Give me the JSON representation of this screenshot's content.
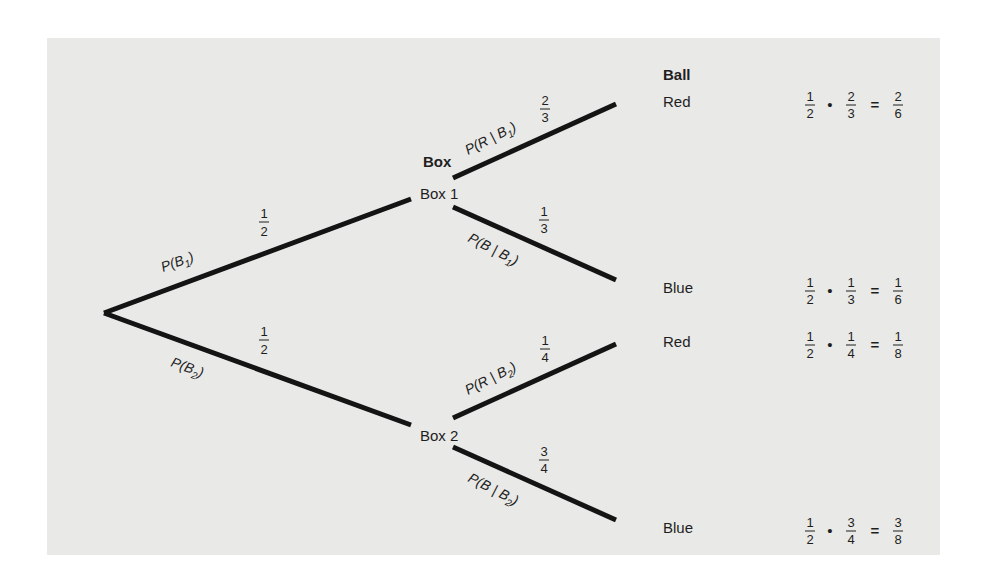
{
  "headers": {
    "box": "Box",
    "ball": "Ball"
  },
  "nodes": {
    "box1": "Box 1",
    "box2": "Box 2",
    "ball_1": "Red",
    "ball_2": "Blue",
    "ball_3": "Red",
    "ball_4": "Blue"
  },
  "branches": {
    "b1": {
      "label": "P(B",
      "sub": "1",
      "close": ")",
      "num": "1",
      "den": "2"
    },
    "b2": {
      "label": "P(B",
      "sub": "2",
      "close": ")",
      "num": "1",
      "den": "2"
    },
    "r_b1": {
      "label": "P(R | B",
      "sub": "1",
      "close": ")",
      "num": "2",
      "den": "3"
    },
    "bl_b1": {
      "label": "P(B | B",
      "sub": "1",
      "close": ")",
      "num": "1",
      "den": "3"
    },
    "r_b2": {
      "label": "P(R | B",
      "sub": "2",
      "close": ")",
      "num": "1",
      "den": "4"
    },
    "bl_b2": {
      "label": "P(B | B",
      "sub": "2",
      "close": ")",
      "num": "3",
      "den": "4"
    }
  },
  "products": [
    {
      "a_num": "1",
      "a_den": "2",
      "op": "•",
      "b_num": "2",
      "b_den": "3",
      "eq": "=",
      "r_num": "2",
      "r_den": "6"
    },
    {
      "a_num": "1",
      "a_den": "2",
      "op": "•",
      "b_num": "1",
      "b_den": "3",
      "eq": "=",
      "r_num": "1",
      "r_den": "6"
    },
    {
      "a_num": "1",
      "a_den": "2",
      "op": "•",
      "b_num": "1",
      "b_den": "4",
      "eq": "=",
      "r_num": "1",
      "r_den": "8"
    },
    {
      "a_num": "1",
      "a_den": "2",
      "op": "•",
      "b_num": "3",
      "b_den": "4",
      "eq": "=",
      "r_num": "3",
      "r_den": "8"
    }
  ],
  "colors": {
    "panel": "#e9e9e7",
    "ink": "#141414"
  }
}
